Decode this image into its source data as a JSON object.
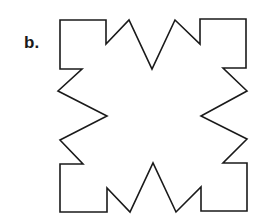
{
  "figure": {
    "label": "b.",
    "shape": {
      "description": "closed polygon outline: square with zig-zag notches on each side",
      "stroke": "#1a1a1a",
      "fill": "none",
      "points": "60,20 106,20 106,44 129,20 152,69 175,20 200,44 200,19 246,19 246,68 223,68 247,91 201,116 247,139 223,163 247,163 247,211 201,211 201,187 176,212 153,163 130,212 107,188 107,212 60,212 60,164 83,164 60,140 107,116 58,91 82,69 60,69"
    }
  }
}
